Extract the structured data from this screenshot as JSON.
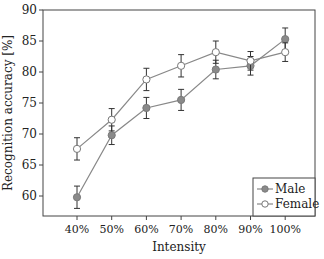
{
  "chart_data": {
    "type": "line",
    "title": "",
    "xlabel": "Intensity",
    "ylabel": "Recognition accuracy [%]",
    "categories": [
      "40%",
      "50%",
      "60%",
      "70%",
      "80%",
      "90%",
      "100%"
    ],
    "ylim": [
      57,
      90
    ],
    "yticks": [
      60,
      65,
      70,
      75,
      80,
      85,
      90
    ],
    "grid": false,
    "legend_position": "lower right",
    "series": [
      {
        "name": "Male",
        "marker": "filled-circle",
        "color": "#888888",
        "values": [
          59.8,
          69.8,
          74.2,
          75.5,
          80.4,
          81.0,
          85.3
        ],
        "errors": [
          1.8,
          1.5,
          1.7,
          1.7,
          1.5,
          1.5,
          1.8
        ]
      },
      {
        "name": "Female",
        "marker": "open-circle",
        "color": "#888888",
        "values": [
          67.6,
          72.3,
          78.8,
          81.0,
          83.2,
          81.8,
          83.2
        ],
        "errors": [
          1.8,
          1.8,
          1.8,
          1.8,
          1.8,
          1.5,
          1.5
        ]
      }
    ]
  }
}
